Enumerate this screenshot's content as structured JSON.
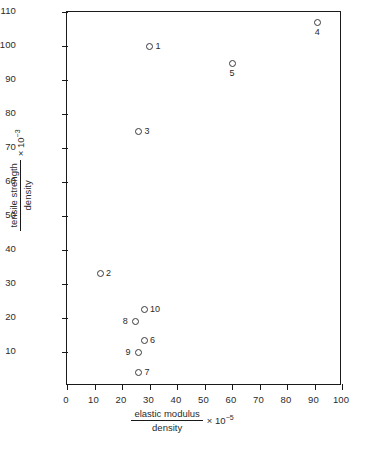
{
  "chart_data": {
    "type": "scatter",
    "title": "",
    "xlabel_numerator": "elastic modulus",
    "xlabel_denominator": "density",
    "xlabel_multiplier": "× 10",
    "xlabel_exponent": "−5",
    "ylabel_numerator": "tensile strength",
    "ylabel_denominator": "density",
    "ylabel_multiplier": "× 10",
    "ylabel_exponent": "−3",
    "xlim": [
      0,
      100
    ],
    "ylim": [
      0,
      110
    ],
    "xticks": [
      0,
      10,
      20,
      30,
      40,
      50,
      60,
      70,
      80,
      90,
      100
    ],
    "yticks": [
      10,
      20,
      30,
      40,
      50,
      60,
      70,
      80,
      90,
      100,
      110
    ],
    "xtick_labels": [
      "0",
      "10",
      "20",
      "30",
      "40",
      "50",
      "60",
      "70",
      "80",
      "90",
      "100"
    ],
    "ytick_labels": [
      "10",
      "20",
      "30",
      "40",
      "50",
      "60",
      "70",
      "80",
      "90",
      "100",
      "110"
    ],
    "grid": false,
    "legend": "none",
    "marker": "open-circle",
    "marker_color": "#3a3a3a",
    "axis_color": "#1a1a1a",
    "background_color": "#ffffff",
    "points": [
      {
        "label": "1",
        "x": 30,
        "y": 100,
        "label_pos": "right"
      },
      {
        "label": "2",
        "x": 12,
        "y": 33,
        "label_pos": "right"
      },
      {
        "label": "3",
        "x": 26,
        "y": 75,
        "label_pos": "right"
      },
      {
        "label": "4",
        "x": 91,
        "y": 107,
        "label_pos": "below"
      },
      {
        "label": "5",
        "x": 60,
        "y": 95,
        "label_pos": "below"
      },
      {
        "label": "6",
        "x": 28,
        "y": 13.5,
        "label_pos": "right"
      },
      {
        "label": "7",
        "x": 26,
        "y": 4,
        "label_pos": "right"
      },
      {
        "label": "8",
        "x": 25,
        "y": 19,
        "label_pos": "left"
      },
      {
        "label": "9",
        "x": 26,
        "y": 10,
        "label_pos": "left"
      },
      {
        "label": "10",
        "x": 28,
        "y": 22.5,
        "label_pos": "right"
      }
    ]
  }
}
